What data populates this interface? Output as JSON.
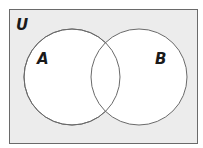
{
  "diagram": {
    "type": "venn",
    "universe_label": "U",
    "sets": [
      {
        "label": "A"
      },
      {
        "label": "B"
      }
    ],
    "colors": {
      "universe_fill": "#ececec",
      "circle_fill": "#ffffff",
      "stroke": "#6a6a6a"
    }
  }
}
